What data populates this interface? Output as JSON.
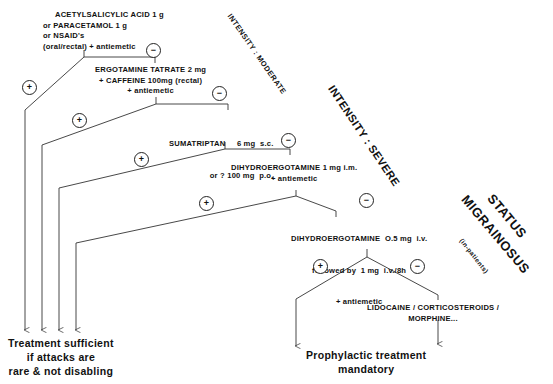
{
  "diagram": {
    "steps": [
      {
        "id": "step1",
        "lines": [
          "ACETYLSALICYLIC ACID 1 g",
          "or PARACETAMOL 1 g",
          "or NSAID's",
          "(oral/rectal) + antiemetic"
        ]
      },
      {
        "id": "step2",
        "lines": [
          "ERGOTAMINE TATRATE 2 mg",
          "+ CAFFEINE 100mg (rectal)",
          "+ antiemetic"
        ]
      },
      {
        "id": "step3",
        "lines": [
          "SUMATRIPTAN     6 mg  s.c.",
          "or ? 100 mg  p.o."
        ]
      },
      {
        "id": "step4",
        "lines": [
          "DIHYDROERGOTAMINE 1 mg i.m.",
          "+ antiemetic"
        ]
      },
      {
        "id": "step5",
        "lines": [
          "DIHYDROERGOTAMINE  O.5 mg  i.v.",
          "followed by  1 mg  i.v./8h",
          "+ antiemetic"
        ]
      },
      {
        "id": "step6",
        "lines": [
          "LIDOCAINE / CORTICOSTEROIDS /",
          "MORPHINE..."
        ]
      }
    ],
    "signs": {
      "plus": "+",
      "minus": "−"
    },
    "outcomes": {
      "sufficient": [
        "Treatment sufficient",
        "if attacks are",
        "rare & not disabling"
      ],
      "prophylactic": [
        "Prophylactic treatment",
        "mandatory"
      ]
    },
    "intensity_labels": {
      "moderate": "INTENSITY : MODERATE",
      "severe": "INTENSITY : SEVERE",
      "status_line1": "STATUS",
      "status_line2": "MIGRAINOSUS",
      "inpatients": "(in-patients)"
    }
  },
  "colors": {
    "line": "#333333",
    "text": "#111111",
    "background": "#ffffff"
  }
}
